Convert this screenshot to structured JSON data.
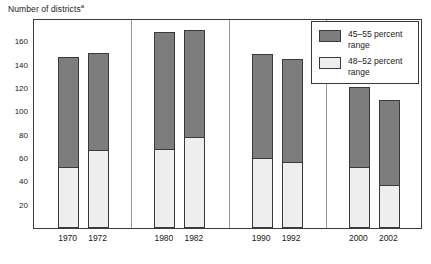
{
  "chart_data": {
    "type": "bar",
    "title": "Number of districts",
    "title_superscript": "a",
    "xlabel": "",
    "ylabel": "",
    "categories": [
      "1970",
      "1972",
      "1980",
      "1982",
      "1990",
      "1992",
      "2000",
      "2002"
    ],
    "series": [
      {
        "name": "45–55 percent range",
        "color": "#7d7d7d",
        "values": [
          147,
          150,
          168,
          170,
          149,
          145,
          121,
          110
        ]
      },
      {
        "name": "48–52 percent range",
        "color": "#eeeeee",
        "values": [
          52,
          67,
          68,
          78,
          60,
          57,
          52,
          37
        ]
      }
    ],
    "ylim": [
      0,
      180
    ],
    "yticks": [
      20,
      40,
      60,
      80,
      100,
      120,
      140,
      160
    ],
    "ytick_labels": [
      "20",
      "40",
      "60",
      "80",
      "100",
      "120",
      "140",
      "160"
    ],
    "grid": false,
    "legend_position": "top-right",
    "group_separators_after": [
      "1972",
      "1982",
      "1992"
    ],
    "groups": [
      {
        "label": "1970s",
        "categories": [
          "1970",
          "1972"
        ]
      },
      {
        "label": "1980s",
        "categories": [
          "1980",
          "1982"
        ]
      },
      {
        "label": "1990s",
        "categories": [
          "1990",
          "1992"
        ]
      },
      {
        "label": "2000s",
        "categories": [
          "2000",
          "2002"
        ]
      }
    ]
  },
  "legend": {
    "entries": [
      {
        "label": "45–55 percent\nrange",
        "swatch": "dark"
      },
      {
        "label": "48–52 percent\nrange",
        "swatch": "light"
      }
    ]
  },
  "colors": {
    "dark_bar": "#7d7d7d",
    "light_bar": "#eeeeee",
    "bar_outline": "#3a3a3a",
    "frame": "#3c3c3c",
    "separator": "#9a9a9a",
    "text": "#1a1a1a",
    "background": "#ffffff"
  }
}
